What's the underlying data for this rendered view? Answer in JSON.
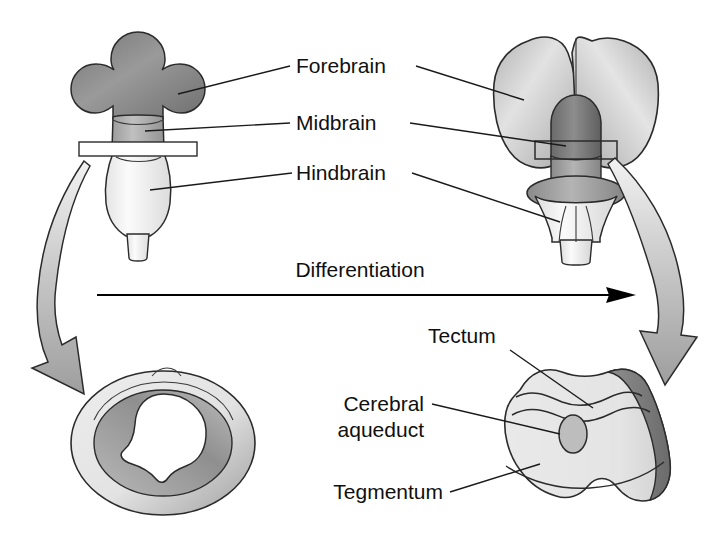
{
  "figure": {
    "title_visible": false,
    "background_color": "#ffffff",
    "process_label": "Differentiation"
  },
  "labels": {
    "forebrain": "Forebrain",
    "midbrain": "Midbrain",
    "hindbrain": "Hindbrain",
    "tectum": "Tectum",
    "cerebral_aqueduct_line1": "Cerebral",
    "cerebral_aqueduct_line2": "aqueduct",
    "tegmentum": "Tegmentum"
  },
  "panels": {
    "embryonic_brain": {
      "name": "embryonic brain (top left)",
      "regions": [
        "forebrain",
        "midbrain",
        "hindbrain"
      ],
      "section_plane": true
    },
    "adult_brain": {
      "name": "differentiated brain (top right)",
      "regions": [
        "forebrain",
        "midbrain",
        "hindbrain"
      ],
      "section_plane": true
    },
    "embryonic_section": {
      "name": "embryonic midbrain cross section (bottom left)",
      "features": [
        "neural canal"
      ]
    },
    "adult_section": {
      "name": "adult midbrain cross section (bottom right)",
      "features": [
        "tectum",
        "cerebral aqueduct",
        "tegmentum"
      ]
    }
  },
  "colors": {
    "forebrain_embryonic": "#8e8e8e",
    "midbrain_embryonic": "#adadad",
    "hindbrain_embryonic": "#f0f0f0",
    "forebrain_adult": "#c9c9c9",
    "midbrain_adult": "#7e7e7e",
    "hindbrain_adult": "#efefef",
    "section_fill": "#e8e8e8",
    "arrow_fill": "#b0b0b0",
    "outline": "#2b2b2b",
    "text": "#101010"
  }
}
